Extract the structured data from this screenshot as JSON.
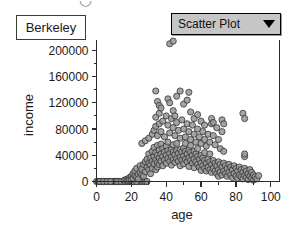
{
  "window": {
    "top_clipped_glyph": "◡"
  },
  "title_box": {
    "label": "Berkeley"
  },
  "plot_type_selector": {
    "value": "Scatter Plot",
    "arrow_icon": "chevron-down-icon",
    "options": [
      "Scatter Plot"
    ],
    "background": "#c6c6c6",
    "border": "#000000"
  },
  "chart_data": {
    "type": "scatter",
    "title": "",
    "subtitle": "",
    "xlabel": "age",
    "ylabel": "income",
    "xlim": [
      0,
      105
    ],
    "ylim": [
      0,
      215000
    ],
    "xticks": [
      0,
      20,
      40,
      60,
      80,
      100
    ],
    "xtick_labels": [
      "0",
      "20",
      "40",
      "60",
      "80",
      "100"
    ],
    "xminor_step": 10,
    "yticks": [
      0,
      40000,
      80000,
      120000,
      160000,
      200000
    ],
    "ytick_labels": [
      "0",
      "40000",
      "80000",
      "120000",
      "160000",
      "200000"
    ],
    "yminor_step": 20000,
    "grid": false,
    "legend": false,
    "marker": {
      "shape": "circle",
      "fill": "#999999",
      "stroke": "#333333",
      "radius": 3.1,
      "opacity": 0.88
    },
    "reference_lines": [
      {
        "axis": "x",
        "value": 0,
        "color": "#c9c9c9"
      }
    ],
    "series": [
      {
        "name": "Berkeley residents",
        "points": [
          [
            0,
            0
          ],
          [
            1,
            0
          ],
          [
            2,
            0
          ],
          [
            3,
            0
          ],
          [
            4,
            0
          ],
          [
            5,
            0
          ],
          [
            6,
            0
          ],
          [
            7,
            0
          ],
          [
            8,
            0
          ],
          [
            9,
            0
          ],
          [
            10,
            0
          ],
          [
            11,
            0
          ],
          [
            12,
            0
          ],
          [
            13,
            0
          ],
          [
            14,
            0
          ],
          [
            15,
            0
          ],
          [
            16,
            0
          ],
          [
            17,
            0
          ],
          [
            18,
            0
          ],
          [
            19,
            0
          ],
          [
            20,
            0
          ],
          [
            21,
            0
          ],
          [
            22,
            0
          ],
          [
            23,
            0
          ],
          [
            24,
            0
          ],
          [
            25,
            0
          ],
          [
            26,
            0
          ],
          [
            27,
            0
          ],
          [
            28,
            0
          ],
          [
            29,
            0
          ],
          [
            1,
            0
          ],
          [
            3,
            0
          ],
          [
            5,
            0
          ],
          [
            7,
            0
          ],
          [
            9,
            0
          ],
          [
            11,
            0
          ],
          [
            13,
            0
          ],
          [
            15,
            0
          ],
          [
            17,
            0
          ],
          [
            19,
            0
          ],
          [
            2,
            0
          ],
          [
            4,
            0
          ],
          [
            6,
            0
          ],
          [
            8,
            0
          ],
          [
            12,
            0
          ],
          [
            14,
            0
          ],
          [
            16,
            0
          ],
          [
            18,
            0
          ],
          [
            21,
            0
          ],
          [
            23,
            0
          ],
          [
            16,
            2000
          ],
          [
            17,
            3000
          ],
          [
            18,
            4000
          ],
          [
            18,
            1500
          ],
          [
            19,
            6000
          ],
          [
            19,
            2500
          ],
          [
            20,
            8000
          ],
          [
            20,
            3000
          ],
          [
            21,
            12000
          ],
          [
            21,
            5000
          ],
          [
            22,
            9000
          ],
          [
            22,
            16000
          ],
          [
            23,
            7000
          ],
          [
            23,
            20000
          ],
          [
            24,
            11000
          ],
          [
            24,
            4000
          ],
          [
            25,
            14000
          ],
          [
            25,
            24000
          ],
          [
            26,
            10000
          ],
          [
            26,
            19000
          ],
          [
            27,
            26000
          ],
          [
            27,
            8000
          ],
          [
            28,
            30000
          ],
          [
            28,
            15000
          ],
          [
            29,
            22000
          ],
          [
            29,
            34000
          ],
          [
            30,
            18000
          ],
          [
            30,
            28000
          ],
          [
            30,
            42000
          ],
          [
            31,
            25000
          ],
          [
            31,
            36000
          ],
          [
            31,
            12000
          ],
          [
            32,
            31000
          ],
          [
            32,
            46000
          ],
          [
            32,
            20000
          ],
          [
            33,
            38000
          ],
          [
            33,
            27000
          ],
          [
            33,
            52000
          ],
          [
            34,
            33000
          ],
          [
            34,
            44000
          ],
          [
            34,
            18000
          ],
          [
            35,
            40000
          ],
          [
            35,
            29000
          ],
          [
            35,
            55000
          ],
          [
            35,
            22000
          ],
          [
            36,
            36000
          ],
          [
            36,
            48000
          ],
          [
            36,
            26000
          ],
          [
            37,
            42000
          ],
          [
            37,
            31000
          ],
          [
            37,
            57000
          ],
          [
            38,
            38000
          ],
          [
            38,
            50000
          ],
          [
            38,
            24000
          ],
          [
            39,
            45000
          ],
          [
            39,
            33000
          ],
          [
            40,
            40000
          ],
          [
            40,
            54000
          ],
          [
            40,
            28000
          ],
          [
            41,
            47000
          ],
          [
            41,
            35000
          ],
          [
            41,
            60000
          ],
          [
            42,
            43000
          ],
          [
            42,
            31000
          ],
          [
            43,
            49000
          ],
          [
            43,
            37000
          ],
          [
            43,
            25000
          ],
          [
            44,
            45000
          ],
          [
            44,
            56000
          ],
          [
            44,
            33000
          ],
          [
            45,
            41000
          ],
          [
            45,
            29000
          ],
          [
            46,
            47000
          ],
          [
            46,
            35000
          ],
          [
            46,
            58000
          ],
          [
            47,
            43000
          ],
          [
            47,
            31000
          ],
          [
            48,
            49000
          ],
          [
            48,
            37000
          ],
          [
            48,
            24000
          ],
          [
            49,
            45000
          ],
          [
            49,
            33000
          ],
          [
            50,
            51000
          ],
          [
            50,
            39000
          ],
          [
            50,
            27000
          ],
          [
            51,
            46000
          ],
          [
            51,
            34000
          ],
          [
            51,
            58000
          ],
          [
            52,
            42000
          ],
          [
            52,
            30000
          ],
          [
            53,
            48000
          ],
          [
            53,
            36000
          ],
          [
            53,
            23000
          ],
          [
            54,
            44000
          ],
          [
            54,
            32000
          ],
          [
            54,
            55000
          ],
          [
            55,
            40000
          ],
          [
            55,
            28000
          ],
          [
            56,
            46000
          ],
          [
            56,
            34000
          ],
          [
            56,
            21000
          ],
          [
            57,
            42000
          ],
          [
            57,
            30000
          ],
          [
            58,
            38000
          ],
          [
            58,
            26000
          ],
          [
            58,
            50000
          ],
          [
            59,
            34000
          ],
          [
            59,
            22000
          ],
          [
            60,
            40000
          ],
          [
            60,
            28000
          ],
          [
            60,
            17000
          ],
          [
            61,
            36000
          ],
          [
            61,
            24000
          ],
          [
            62,
            32000
          ],
          [
            62,
            20000
          ],
          [
            62,
            44000
          ],
          [
            63,
            28000
          ],
          [
            63,
            16000
          ],
          [
            64,
            34000
          ],
          [
            64,
            22000
          ],
          [
            65,
            30000
          ],
          [
            65,
            18000
          ],
          [
            65,
            42000
          ],
          [
            66,
            26000
          ],
          [
            66,
            14000
          ],
          [
            67,
            32000
          ],
          [
            67,
            20000
          ],
          [
            68,
            28000
          ],
          [
            68,
            16000
          ],
          [
            69,
            24000
          ],
          [
            69,
            12000
          ],
          [
            70,
            30000
          ],
          [
            70,
            18000
          ],
          [
            70,
            8000
          ],
          [
            71,
            26000
          ],
          [
            71,
            14000
          ],
          [
            72,
            22000
          ],
          [
            72,
            10000
          ],
          [
            73,
            28000
          ],
          [
            73,
            16000
          ],
          [
            74,
            24000
          ],
          [
            74,
            12000
          ],
          [
            75,
            20000
          ],
          [
            75,
            8000
          ],
          [
            76,
            26000
          ],
          [
            76,
            14000
          ],
          [
            77,
            22000
          ],
          [
            77,
            10000
          ],
          [
            78,
            18000
          ],
          [
            78,
            6000
          ],
          [
            79,
            24000
          ],
          [
            79,
            12000
          ],
          [
            80,
            20000
          ],
          [
            80,
            8000
          ],
          [
            81,
            16000
          ],
          [
            81,
            5000
          ],
          [
            82,
            22000
          ],
          [
            82,
            10000
          ],
          [
            83,
            18000
          ],
          [
            83,
            7000
          ],
          [
            84,
            14000
          ],
          [
            84,
            4000
          ],
          [
            85,
            20000
          ],
          [
            85,
            9000
          ],
          [
            85,
            38000
          ],
          [
            85,
            42000
          ],
          [
            86,
            16000
          ],
          [
            86,
            6000
          ],
          [
            87,
            12000
          ],
          [
            87,
            3000
          ],
          [
            88,
            18000
          ],
          [
            88,
            8000
          ],
          [
            89,
            14000
          ],
          [
            89,
            5000
          ],
          [
            90,
            10000
          ],
          [
            90,
            2000
          ],
          [
            91,
            7000
          ],
          [
            92,
            4000
          ],
          [
            93,
            9000
          ],
          [
            26,
            58000
          ],
          [
            28,
            62000
          ],
          [
            30,
            66000
          ],
          [
            32,
            72000
          ],
          [
            33,
            78000
          ],
          [
            34,
            84000
          ],
          [
            34,
            98000
          ],
          [
            35,
            70000
          ],
          [
            36,
            88000
          ],
          [
            36,
            104000
          ],
          [
            37,
            76000
          ],
          [
            38,
            92000
          ],
          [
            39,
            68000
          ],
          [
            40,
            100000
          ],
          [
            41,
            86000
          ],
          [
            42,
            74000
          ],
          [
            43,
            96000
          ],
          [
            44,
            82000
          ],
          [
            45,
            70000
          ],
          [
            46,
            90000
          ],
          [
            47,
            78000
          ],
          [
            48,
            66000
          ],
          [
            49,
            94000
          ],
          [
            50,
            80000
          ],
          [
            51,
            68000
          ],
          [
            52,
            88000
          ],
          [
            53,
            76000
          ],
          [
            54,
            64000
          ],
          [
            55,
            86000
          ],
          [
            56,
            72000
          ],
          [
            57,
            60000
          ],
          [
            58,
            80000
          ],
          [
            59,
            68000
          ],
          [
            60,
            58000
          ],
          [
            61,
            76000
          ],
          [
            62,
            64000
          ],
          [
            63,
            54000
          ],
          [
            64,
            72000
          ],
          [
            65,
            60000
          ],
          [
            66,
            88000
          ],
          [
            67,
            70000
          ],
          [
            68,
            56000
          ],
          [
            69,
            82000
          ],
          [
            70,
            64000
          ],
          [
            71,
            50000
          ],
          [
            72,
            76000
          ],
          [
            73,
            46000
          ],
          [
            34,
            138000
          ],
          [
            35,
            122000
          ],
          [
            36,
            116000
          ],
          [
            37,
            112000
          ],
          [
            41,
            126000
          ],
          [
            42,
            120000
          ],
          [
            46,
            130000
          ],
          [
            48,
            138000
          ],
          [
            50,
            118000
          ],
          [
            52,
            124000
          ],
          [
            53,
            136000
          ],
          [
            54,
            106000
          ],
          [
            44,
            108000
          ],
          [
            45,
            100000
          ],
          [
            56,
            96000
          ],
          [
            58,
            102000
          ],
          [
            60,
            92000
          ],
          [
            62,
            86000
          ],
          [
            66,
            96000
          ],
          [
            67,
            90000
          ],
          [
            72,
            94000
          ],
          [
            73,
            88000
          ],
          [
            84,
            104000
          ],
          [
            85,
            96000
          ],
          [
            42,
            210000
          ],
          [
            44,
            214000
          ]
        ]
      }
    ]
  }
}
